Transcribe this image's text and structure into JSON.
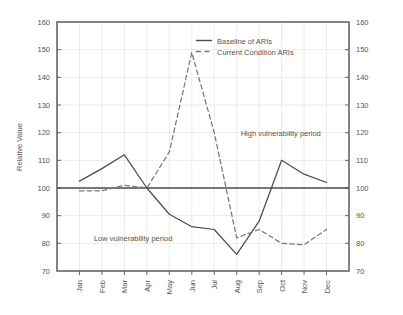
{
  "chart_data": {
    "type": "line",
    "title": "",
    "xlabel": "",
    "ylabel": "Relative Value",
    "categories": [
      "Jan",
      "Feb",
      "Mar",
      "Apr",
      "May",
      "Jun",
      "Jul",
      "Aug",
      "Sep",
      "Oct",
      "Nov",
      "Dec"
    ],
    "ylim": [
      70,
      160
    ],
    "yticks": [
      70,
      80,
      90,
      100,
      110,
      120,
      130,
      140,
      150,
      160
    ],
    "ytick_labels": [
      "70",
      "80",
      "90",
      "100",
      "110",
      "120",
      "130",
      "140",
      "150",
      "160"
    ],
    "right_axis_mirrored": true,
    "grid": true,
    "legend_position": "top-center",
    "reference_line": 100,
    "series": [
      {
        "name": "Baseline of ARIs",
        "style": "solid",
        "color": "#4d4d4d",
        "values": [
          102.5,
          107,
          112,
          100,
          90.5,
          86,
          85,
          76,
          88,
          110,
          105,
          102
        ]
      },
      {
        "name": "Current Condition ARIs",
        "style": "dashed",
        "color": "#777777",
        "values": [
          99,
          99,
          101,
          100,
          113,
          149,
          120,
          82,
          85,
          80,
          79.5,
          85
        ]
      }
    ],
    "annotations": [
      {
        "text": "High vulnerability period",
        "x_category": "Aug",
        "y_value": 120
      },
      {
        "text": "Low vulnerability period",
        "x_category": "Feb",
        "y_value": 82
      }
    ]
  },
  "legend": {
    "items": [
      {
        "label": "Baseline of ARIs",
        "style": "solid"
      },
      {
        "label": "Current Condition ARIs",
        "style": "dashed"
      }
    ]
  },
  "axes": {
    "y_left_title": "Relative Value",
    "y_left_ticks": [
      "160",
      "150",
      "140",
      "130",
      "120",
      "110",
      "100",
      "90",
      "80",
      "70"
    ],
    "y_right_ticks": [
      "160",
      "150",
      "140",
      "130",
      "120",
      "110",
      "100",
      "90",
      "80",
      "70"
    ],
    "x_ticks": [
      "Jan",
      "Feb",
      "Mar",
      "Apr",
      "May",
      "Jun",
      "Jul",
      "Aug",
      "Sep",
      "Oct",
      "Nov",
      "Dec"
    ]
  },
  "annotations": {
    "high": "High vulnerability period",
    "low": "Low vulnerability period"
  },
  "colors": {
    "baseline": "#4d4d4d",
    "current": "#777777",
    "border": "#666666",
    "grid": "#e2e2e2",
    "text": "#555555"
  }
}
